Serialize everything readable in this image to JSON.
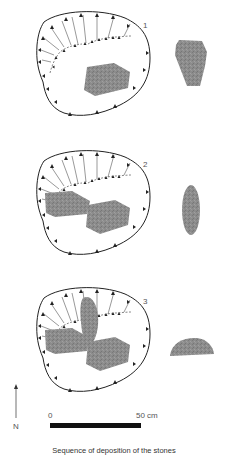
{
  "panels": [
    {
      "number": "1",
      "description": "Pit plan with first stone deposited; side view of stone at right"
    },
    {
      "number": "2",
      "description": "Pit plan with two stones deposited; side view of second stone at right"
    },
    {
      "number": "3",
      "description": "Pit plan with three stones deposited; side view of third stone at right"
    }
  ],
  "north_arrow": {
    "label": "N"
  },
  "scale_bar": {
    "start_label": "0",
    "end_label": "50 cm"
  },
  "caption": "Sequence of deposition of the stones",
  "colors": {
    "line": "#222222",
    "stone": "#8a8a8a",
    "stone_dark": "#6e6e6e",
    "scale_bar": "#111111"
  }
}
